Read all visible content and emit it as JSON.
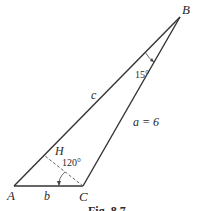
{
  "figure": {
    "vertices": {
      "A": {
        "label": "A",
        "x": 14,
        "y": 186
      },
      "B": {
        "label": "B",
        "x": 180,
        "y": 17
      },
      "C": {
        "label": "C",
        "x": 83,
        "y": 186
      },
      "H": {
        "label": "H",
        "x": 48,
        "y": 152
      }
    },
    "sides": {
      "a": {
        "label": "a = 6"
      },
      "b": {
        "label": "b"
      },
      "c": {
        "label": "c"
      }
    },
    "angles": {
      "B": {
        "label": "15°"
      },
      "ACH": {
        "label": "120°"
      }
    },
    "caption": "Fig. 8.7"
  }
}
